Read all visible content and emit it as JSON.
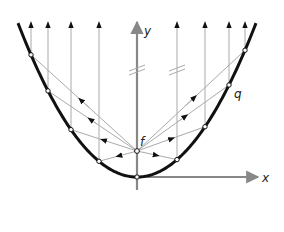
{
  "diagram": {
    "labels": {
      "y_axis": "y",
      "x_axis": "x",
      "focus": "f",
      "point": "q"
    },
    "colors": {
      "parabola": "#111111",
      "axis": "#888888",
      "ray": "#aaaaaa",
      "arrow": "#111111"
    },
    "geometry": {
      "vertex": [
        137,
        177
      ],
      "focus": [
        137,
        151
      ],
      "focal_param": 92,
      "ray_x_positions": [
        31,
        48,
        71,
        99,
        177,
        205,
        229,
        245
      ]
    }
  }
}
